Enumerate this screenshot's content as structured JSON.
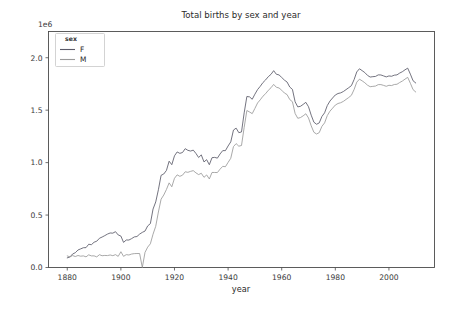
{
  "figure": {
    "title": "Total births by sex and year",
    "y_offset_text": "1e6",
    "background_color": "#ffffff"
  },
  "axes": {
    "xlabel": "year",
    "ylabel": "",
    "x_ticks": [
      "1880",
      "1900",
      "1920",
      "1940",
      "1960",
      "1980",
      "2000"
    ],
    "y_ticks": [
      "0.0",
      "0.5",
      "1.0",
      "1.5",
      "2.0"
    ]
  },
  "legend": {
    "title": "sex",
    "entries": [
      {
        "label": "F",
        "color": "#5a5a68"
      },
      {
        "label": "M",
        "color": "#9a9a9a"
      }
    ]
  },
  "chart_data": {
    "type": "line",
    "title": "Total births by sex and year",
    "xlabel": "year",
    "ylabel": "",
    "y_offset_multiplier": 1000000,
    "xlim": [
      1873,
      2017
    ],
    "ylim": [
      0,
      2250000
    ],
    "x_tick_values": [
      1880,
      1900,
      1920,
      1940,
      1960,
      1980,
      2000
    ],
    "y_tick_values": [
      0,
      500000,
      1000000,
      1500000,
      2000000
    ],
    "grid": false,
    "legend_position": "upper left",
    "legend_title": "sex",
    "x": [
      1880,
      1881,
      1882,
      1883,
      1884,
      1885,
      1886,
      1887,
      1888,
      1889,
      1890,
      1891,
      1892,
      1893,
      1894,
      1895,
      1896,
      1897,
      1898,
      1899,
      1900,
      1901,
      1902,
      1903,
      1904,
      1905,
      1906,
      1907,
      1908,
      1909,
      1910,
      1911,
      1912,
      1913,
      1914,
      1915,
      1916,
      1917,
      1918,
      1919,
      1920,
      1921,
      1922,
      1923,
      1924,
      1925,
      1926,
      1927,
      1928,
      1929,
      1930,
      1931,
      1932,
      1933,
      1934,
      1935,
      1936,
      1937,
      1938,
      1939,
      1940,
      1941,
      1942,
      1943,
      1944,
      1945,
      1946,
      1947,
      1948,
      1949,
      1950,
      1951,
      1952,
      1953,
      1954,
      1955,
      1956,
      1957,
      1958,
      1959,
      1960,
      1961,
      1962,
      1963,
      1964,
      1965,
      1966,
      1967,
      1968,
      1969,
      1970,
      1971,
      1972,
      1973,
      1974,
      1975,
      1976,
      1977,
      1978,
      1979,
      1980,
      1981,
      1982,
      1983,
      1984,
      1985,
      1986,
      1987,
      1988,
      1989,
      1990,
      1991,
      1992,
      1993,
      1994,
      1995,
      1996,
      1997,
      1998,
      1999,
      2000,
      2001,
      2002,
      2003,
      2004,
      2005,
      2006,
      2007,
      2008,
      2009,
      2010
    ],
    "series": [
      {
        "name": "F",
        "color": "#5a5a68",
        "values": [
          91954,
          100595,
          128790,
          140976,
          166897,
          177533,
          188451,
          189318,
          221558,
          217310,
          240888,
          250755,
          278643,
          290441,
          304043,
          318539,
          329027,
          327519,
          341561,
          310449,
          299868,
          239350,
          262151,
          261821,
          275309,
          291444,
          295301,
          318449,
          334894,
          347278,
          396416,
          418081,
          557046,
          624903,
          741438,
          878764,
          891533,
          925505,
          1013560,
          980139,
          1064840,
          1101762,
          1088265,
          1096445,
          1132894,
          1116998,
          1110255,
          1118896,
          1087570,
          1048763,
          1073676,
          1006646,
          1028098,
          980031,
          1046928,
          1049889,
          1042761,
          1082295,
          1114342,
          1114034,
          1158680,
          1197759,
          1310208,
          1328661,
          1285442,
          1292322,
          1474589,
          1630164,
          1626749,
          1603924,
          1652434,
          1696572,
          1727409,
          1763304,
          1788632,
          1819470,
          1841476,
          1876510,
          1842347,
          1836106,
          1811890,
          1786840,
          1768240,
          1720260,
          1698060,
          1579750,
          1531260,
          1536880,
          1554890,
          1574650,
          1532840,
          1452420,
          1385380,
          1365680,
          1378640,
          1439860,
          1474920,
          1543620,
          1587010,
          1616440,
          1644960,
          1658760,
          1665000,
          1677770,
          1695890,
          1714180,
          1733760,
          1791090,
          1864480,
          1894570,
          1876820,
          1858670,
          1831780,
          1815730,
          1819330,
          1821640,
          1836290,
          1835690,
          1826570,
          1817180,
          1826280,
          1823280,
          1833660,
          1836280,
          1853560,
          1866590,
          1884620,
          1900630,
          1843380,
          1780560,
          1759010
        ],
        "note": "Female births, darker gray line"
      },
      {
        "name": "M",
        "color": "#9a9a9a",
        "values": [
          110491,
          100745,
          113688,
          104629,
          114445,
          107800,
          110784,
          101454,
          120695,
          110581,
          111025,
          101191,
          122037,
          112316,
          115060,
          113683,
          119435,
          112824,
          122693,
          106212,
          150483,
          106471,
          122660,
          119238,
          128125,
          132319,
          133159,
          144,
          142,
          144118,
          194198,
          225917,
          317446,
          392927,
          529030,
          651264,
          691240,
          744063,
          806828,
          769440,
          850585,
          883280,
          869244,
          880246,
          912570,
          907460,
          916498,
          923460,
          902229,
          885790,
          898240,
          859680,
          882470,
          844140,
          906100,
          905970,
          905250,
          937480,
          964330,
          960780,
          1002070,
          1041260,
          1152580,
          1180860,
          1156540,
          1163240,
          1336540,
          1496830,
          1482580,
          1467000,
          1516640,
          1568840,
          1598870,
          1633180,
          1657400,
          1689300,
          1713590,
          1745700,
          1718400,
          1711600,
          1690160,
          1663620,
          1648480,
          1601190,
          1580470,
          1468350,
          1422400,
          1429600,
          1445980,
          1465830,
          1425730,
          1351030,
          1289400,
          1272700,
          1285780,
          1346000,
          1378800,
          1448200,
          1490400,
          1519200,
          1548800,
          1563700,
          1570900,
          1583800,
          1602300,
          1620700,
          1641600,
          1696500,
          1767000,
          1795100,
          1779800,
          1761500,
          1738300,
          1723600,
          1726900,
          1729800,
          1743500,
          1743900,
          1736100,
          1727600,
          1737100,
          1734700,
          1744600,
          1747000,
          1763400,
          1777600,
          1795800,
          1812900,
          1756200,
          1695900,
          1673000
        ],
        "note": "Male births, lighter gray line"
      }
    ]
  }
}
